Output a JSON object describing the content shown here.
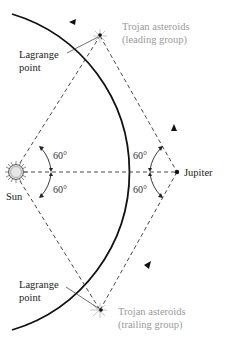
{
  "diagram": {
    "bodies": {
      "sun": {
        "label": "Sun"
      },
      "jupiter": {
        "label": "Jupiter"
      }
    },
    "groups": {
      "leading": {
        "line1": "Trojan asteroids",
        "line2": "(leading group)"
      },
      "trailing": {
        "line1": "Trojan asteroids",
        "line2": "(trailing group)"
      }
    },
    "lagrange_top": {
      "line1": "Lagrange",
      "line2": "point"
    },
    "lagrange_bottom": {
      "line1": "Lagrange",
      "line2": "point"
    },
    "angles": {
      "sun_upper": "60°",
      "sun_lower": "60°",
      "jupiter_upper": "60°",
      "jupiter_lower": "60°"
    },
    "colors": {
      "ink": "#222222",
      "gray_label": "#9a9a9a",
      "sun_fill": "#d9d9d9"
    }
  }
}
